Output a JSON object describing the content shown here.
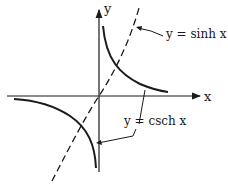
{
  "diagram": {
    "title": "",
    "axes": {
      "x_label": "x",
      "y_label": "y"
    },
    "curves": [
      {
        "name": "sinh",
        "label": "y = sinh x",
        "style": "dashed"
      },
      {
        "name": "csch",
        "label": "y = csch x",
        "style": "solid"
      }
    ],
    "colors": {
      "ink": "#1a1a1a",
      "background": "#ffffff"
    }
  }
}
